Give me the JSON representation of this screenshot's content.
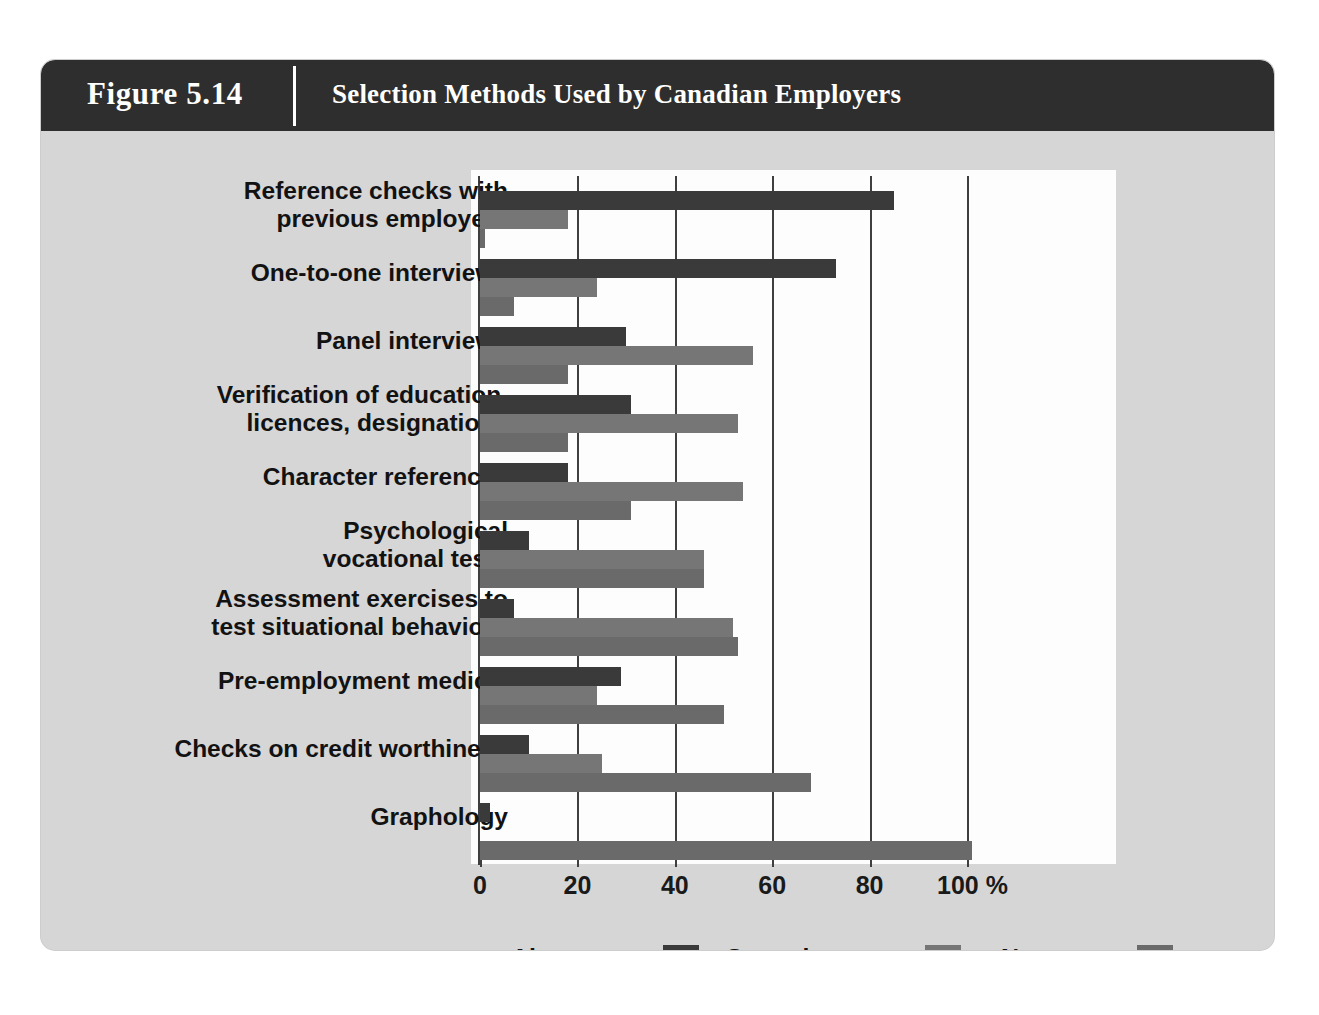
{
  "figure": {
    "number": "Figure 5.14",
    "title": "Selection Methods Used by Canadian Employers"
  },
  "colors": {
    "header_bar": "#2e2e2e",
    "card_background": "#d6d6d6",
    "plot_background": "#fdfdfd",
    "always_use": "#3a3a3a",
    "sometimes_use": "#767676",
    "never_use": "#6a6a6a",
    "axis": "#3f3f3f"
  },
  "legend": {
    "position": "bottom",
    "entries": [
      {
        "label": "Always use",
        "color": "#3a3a3a",
        "key": "always"
      },
      {
        "label": "Sometimes use",
        "color": "#767676",
        "key": "sometimes"
      },
      {
        "label": "Never use",
        "color": "#6a6a6a",
        "key": "never"
      }
    ]
  },
  "axis": {
    "unit_suffix": "%",
    "ticks": [
      "0",
      "20",
      "40",
      "60",
      "80",
      "100 %"
    ],
    "tick_values": [
      0,
      20,
      40,
      60,
      80,
      100
    ]
  },
  "chart_data": {
    "type": "bar",
    "orientation": "horizontal",
    "title": "Selection Methods Used by Canadian Employers",
    "xlabel": "%",
    "ylabel": "",
    "xlim": [
      0,
      105
    ],
    "grid": true,
    "legend_position": "bottom",
    "categories": [
      "Reference checks with\nprevious employers",
      "One-to-one interviews",
      "Panel interviews",
      "Verification of education,\nlicences, designations",
      "Character references",
      "Psychological\nvocational tests",
      "Assessment exercises to\ntest situational behaviour",
      "Pre-employment medical",
      "Checks on credit worthiness",
      "Graphology"
    ],
    "series": [
      {
        "name": "Always use",
        "color": "#3a3a3a",
        "values": [
          85,
          73,
          30,
          31,
          18,
          10,
          7,
          29,
          10,
          2
        ]
      },
      {
        "name": "Sometimes use",
        "color": "#767676",
        "values": [
          18,
          24,
          56,
          53,
          54,
          46,
          52,
          24,
          25,
          0
        ]
      },
      {
        "name": "Never use",
        "color": "#6a6a6a",
        "values": [
          1,
          7,
          18,
          18,
          31,
          46,
          53,
          50,
          68,
          101
        ]
      }
    ]
  }
}
